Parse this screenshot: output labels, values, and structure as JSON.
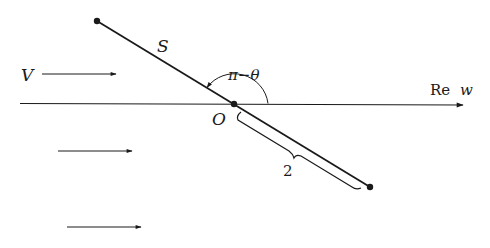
{
  "diagram": {
    "labels": {
      "flow": "V",
      "plate": "S",
      "angle": "π−θ",
      "origin": "O",
      "axis_re": "Re",
      "axis_var": "w",
      "half_length": "2"
    },
    "colors": {
      "stroke": "#1a1a1a",
      "background": "#ffffff"
    }
  }
}
